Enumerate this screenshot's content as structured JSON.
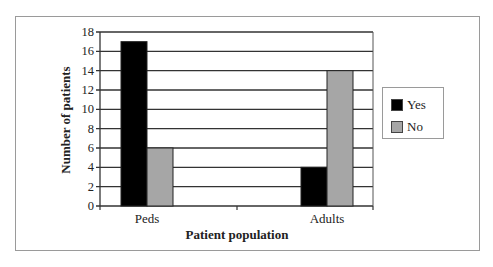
{
  "chart_data": {
    "type": "bar",
    "title": "",
    "xlabel": "Patient population",
    "ylabel": "Number of patients",
    "categories": [
      "Peds",
      "Adults"
    ],
    "series": [
      {
        "name": "Yes",
        "color": "#000000",
        "values": [
          17,
          4
        ]
      },
      {
        "name": "No",
        "color": "#a6a6a6",
        "values": [
          6,
          14
        ]
      }
    ],
    "ylim": [
      0,
      18
    ],
    "yticks": [
      "0",
      "2",
      "4",
      "6",
      "8",
      "10",
      "12",
      "14",
      "16",
      "18"
    ],
    "grid": true,
    "legend_position": "right"
  },
  "legend": {
    "yes": "Yes",
    "no": "No"
  },
  "colors": {
    "yes": "#000000",
    "no": "#a6a6a6"
  }
}
